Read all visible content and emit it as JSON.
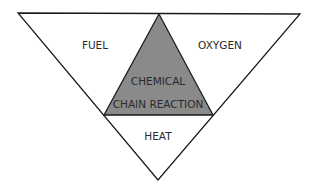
{
  "diagram": {
    "outer_triangle": {
      "points": [
        [
          18,
          13
        ],
        [
          300,
          14
        ],
        [
          158,
          180
        ]
      ],
      "stroke": "#1a1a1a",
      "fill": "#ffffff"
    },
    "inner_triangle": {
      "points": [
        [
          159,
          14
        ],
        [
          104,
          115
        ],
        [
          213,
          115
        ]
      ],
      "stroke": "#1a1a1a",
      "fill": "#8a8a8a"
    },
    "labels": {
      "fuel": {
        "text": "FUEL",
        "x": 95,
        "y": 49
      },
      "oxygen": {
        "text": "OXYGEN",
        "x": 220,
        "y": 49
      },
      "chemical": {
        "text": "CHEMICAL",
        "x": 158,
        "y": 85
      },
      "chain_reaction": {
        "text": "CHAIN REACTION",
        "x": 158,
        "y": 108
      },
      "heat": {
        "text": "HEAT",
        "x": 158,
        "y": 140
      }
    }
  }
}
